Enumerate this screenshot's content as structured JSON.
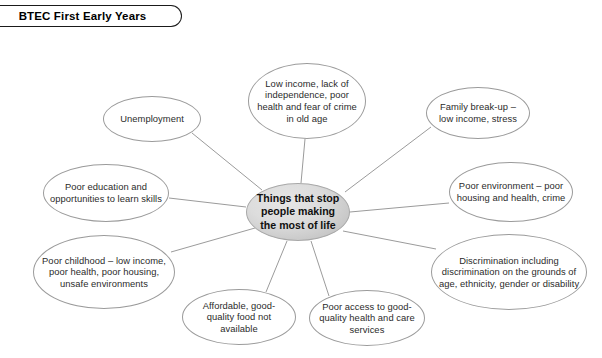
{
  "header": {
    "title": "BTEC First Early Years"
  },
  "diagram": {
    "type": "spider-web-mind-map",
    "center": {
      "label": "Things that stop people making the most of life",
      "cx": 298,
      "cy": 212,
      "rx": 52,
      "ry": 29,
      "fill": "#d6d6d6",
      "stroke": "#a8a8a8"
    },
    "node_style": {
      "stroke": "#9b9b9b",
      "fill": "transparent",
      "text_color": "#2b2b2b"
    },
    "connector_color": "#9b9b9b",
    "nodes": [
      {
        "id": "unemployment",
        "label": "Unemployment",
        "cx": 152,
        "cy": 119,
        "rx": 49,
        "ry": 23
      },
      {
        "id": "low-income-old-age",
        "label": "Low income, lack of independence, poor health and fear of crime in old age",
        "cx": 307,
        "cy": 101,
        "rx": 59,
        "ry": 38
      },
      {
        "id": "family-break-up",
        "label": "Family break-up – low income, stress",
        "cx": 478,
        "cy": 113,
        "rx": 52,
        "ry": 26
      },
      {
        "id": "poor-education",
        "label": "Poor education and opportunities to learn skills",
        "cx": 106,
        "cy": 193,
        "rx": 63,
        "ry": 29
      },
      {
        "id": "poor-environment",
        "label": "Poor environment – poor housing and health, crime",
        "cx": 511,
        "cy": 192,
        "rx": 62,
        "ry": 30
      },
      {
        "id": "poor-childhood",
        "label": "Poor childhood – low income, poor health, poor housing, unsafe environments",
        "cx": 104,
        "cy": 272,
        "rx": 71,
        "ry": 37
      },
      {
        "id": "discrimination",
        "label": "Discrimination including discrimination on the grounds of age, ethnicity, gender or disability",
        "cx": 509,
        "cy": 272,
        "rx": 78,
        "ry": 38
      },
      {
        "id": "affordable-food",
        "label": "Affordable, good-quality food not available",
        "cx": 239,
        "cy": 317,
        "rx": 57,
        "ry": 28
      },
      {
        "id": "poor-access-health",
        "label": "Poor access to good-quality health and care services",
        "cx": 367,
        "cy": 318,
        "rx": 58,
        "ry": 28
      }
    ],
    "connectors": [
      {
        "from": "unemployment",
        "x1": 192,
        "y1": 133,
        "x2": 262,
        "y2": 190
      },
      {
        "from": "low-income-old-age",
        "x1": 305,
        "y1": 139,
        "x2": 301,
        "y2": 183
      },
      {
        "from": "family-break-up",
        "x1": 431,
        "y1": 127,
        "x2": 345,
        "y2": 192
      },
      {
        "from": "poor-education",
        "x1": 169,
        "y1": 198,
        "x2": 246,
        "y2": 207
      },
      {
        "from": "poor-environment",
        "x1": 449,
        "y1": 203,
        "x2": 350,
        "y2": 212
      },
      {
        "from": "poor-childhood",
        "x1": 171,
        "y1": 252,
        "x2": 255,
        "y2": 228
      },
      {
        "from": "discrimination",
        "x1": 436,
        "y1": 249,
        "x2": 343,
        "y2": 231
      },
      {
        "from": "affordable-food",
        "x1": 266,
        "y1": 292,
        "x2": 287,
        "y2": 241
      },
      {
        "from": "poor-access-health",
        "x1": 329,
        "y1": 296,
        "x2": 311,
        "y2": 241
      }
    ]
  }
}
